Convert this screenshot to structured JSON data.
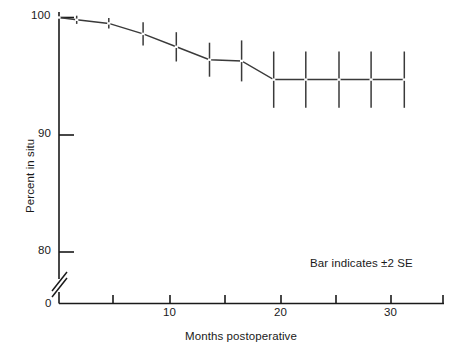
{
  "chart_data": {
    "type": "line",
    "title": "",
    "xlabel": "Months postoperative",
    "ylabel": "Percent in situ",
    "annotation": "Bar indicates ±2 SE",
    "xlim": [
      0,
      33
    ],
    "ylim": [
      78,
      100.6
    ],
    "y_axis_break": true,
    "y_break_note": "axis broken between 0 and ~78",
    "grid": false,
    "legend": false,
    "xticks": [
      0,
      5,
      10,
      15,
      20,
      25,
      30,
      32.8
    ],
    "xticklabels": [
      "0",
      "",
      "10",
      "",
      "20",
      "",
      "30",
      ""
    ],
    "yticks": [
      80,
      90,
      100
    ],
    "yticklabels": [
      "80",
      "90",
      "100"
    ],
    "error_bar_description": "vertical bar = ±2 standard errors",
    "x": [
      0,
      1.6,
      4.5,
      7.6,
      10.6,
      13.6,
      16.5,
      19.4,
      22.3,
      25.3,
      28.2,
      31.2
    ],
    "y": [
      100.0,
      99.8,
      99.5,
      98.6,
      97.5,
      96.4,
      96.3,
      94.7,
      94.7,
      94.7,
      94.7,
      94.7
    ],
    "yerr": [
      0.0,
      0.35,
      0.45,
      1.0,
      1.25,
      1.45,
      1.75,
      2.4,
      2.4,
      2.4,
      2.4,
      2.4
    ],
    "series": [
      {
        "name": "Percent in situ",
        "points": [
          {
            "month": 0.0,
            "percent": 100.0,
            "se2": 0.0
          },
          {
            "month": 1.6,
            "percent": 99.8,
            "se2": 0.35
          },
          {
            "month": 4.5,
            "percent": 99.5,
            "se2": 0.45
          },
          {
            "month": 7.6,
            "percent": 98.6,
            "se2": 1.0
          },
          {
            "month": 10.6,
            "percent": 97.5,
            "se2": 1.25
          },
          {
            "month": 13.6,
            "percent": 96.4,
            "se2": 1.45
          },
          {
            "month": 16.5,
            "percent": 96.3,
            "se2": 1.75
          },
          {
            "month": 19.4,
            "percent": 94.7,
            "se2": 2.4
          },
          {
            "month": 22.3,
            "percent": 94.7,
            "se2": 2.4
          },
          {
            "month": 25.3,
            "percent": 94.7,
            "se2": 2.4
          },
          {
            "month": 28.2,
            "percent": 94.7,
            "se2": 2.4
          },
          {
            "month": 31.2,
            "percent": 94.7,
            "se2": 2.4
          }
        ]
      }
    ]
  },
  "labels": {
    "ylabel": "Percent in situ",
    "xlabel": "Months postoperative",
    "annotation": "Bar indicates ±2 SE",
    "y_100": "100",
    "y_90": "90",
    "y_80": "80",
    "y_0": "0",
    "x_10": "10",
    "x_20": "20",
    "x_30": "30"
  },
  "colors": {
    "axis": "#1a1a1a",
    "line": "#3a3a3a",
    "error_bar": "#3a3a3a",
    "background": "#ffffff",
    "text": "#1a1a1a"
  }
}
